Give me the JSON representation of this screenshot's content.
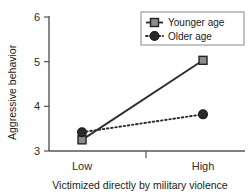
{
  "chart_data": {
    "type": "line",
    "title": "",
    "xlabel": "Victimized directly by military violence",
    "ylabel": "Aggressive behavior",
    "categories": [
      "Low",
      "High"
    ],
    "ylim": [
      3,
      6
    ],
    "yticks": [
      3,
      4,
      5,
      6
    ],
    "ytick_labels": [
      "3",
      "4",
      "5",
      "6"
    ],
    "grid": false,
    "legend_position": "top-right",
    "series": [
      {
        "name": "Younger age",
        "values": [
          3.25,
          5.03
        ],
        "line_style": "solid",
        "marker": "square",
        "marker_fill": "#8c8c8c",
        "line_color": "#2e2e2e"
      },
      {
        "name": "Older age",
        "values": [
          3.42,
          3.82
        ],
        "line_style": "dotted",
        "marker": "circle",
        "marker_fill": "#2b2b2b",
        "line_color": "#2b2b2b"
      }
    ]
  },
  "axes": {
    "y_tick_0": "3",
    "y_tick_1": "4",
    "y_tick_2": "5",
    "y_tick_3": "6",
    "x_cat_0": "Low",
    "x_cat_1": "High",
    "y_title": "Aggressive behavior",
    "x_title": "Victimized directly by military violence"
  },
  "legend": {
    "entry_0": "Younger age",
    "entry_1": "Older age"
  }
}
